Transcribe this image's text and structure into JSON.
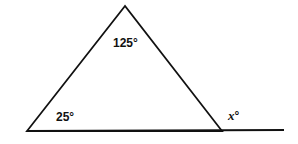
{
  "diagram": {
    "type": "triangle-exterior-angle",
    "angles": {
      "apex": "125°",
      "bottom_left": "25°",
      "exterior": "x°"
    },
    "exterior_variable": "x",
    "degree_symbol": "°",
    "colors": {
      "stroke": "#111111",
      "background": "#ffffff"
    }
  }
}
